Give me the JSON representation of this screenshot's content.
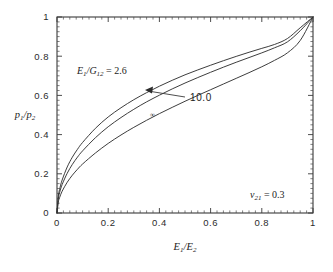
{
  "chart_data": {
    "type": "line",
    "title": "",
    "xlabel": "E₁/E₂",
    "ylabel": "p₁/p₂",
    "xlim": [
      0,
      1
    ],
    "ylim": [
      0,
      1
    ],
    "xticks": [
      "0",
      "0.2",
      "0.4",
      "0.6",
      "0.8",
      "1"
    ],
    "xtick_values": [
      0,
      0.2,
      0.4,
      0.6,
      0.8,
      1
    ],
    "yticks": [
      "0",
      "0.2",
      "0.4",
      "0.6",
      "0.8",
      "1"
    ],
    "ytick_values": [
      0,
      0.2,
      0.4,
      0.6,
      0.8,
      1
    ],
    "grid": false,
    "legend_position": "inline-annotations",
    "minor_ticks": true,
    "series": [
      {
        "name": "E1/G12 = 2.6",
        "label": "2.6",
        "x": [
          0.0,
          0.005,
          0.01,
          0.02,
          0.04,
          0.06,
          0.08,
          0.1,
          0.15,
          0.2,
          0.25,
          0.3,
          0.35,
          0.4,
          0.45,
          0.5,
          0.55,
          0.6,
          0.65,
          0.7,
          0.75,
          0.8,
          0.85,
          0.9,
          0.95,
          1.0
        ],
        "y": [
          0.0,
          0.085,
          0.12,
          0.168,
          0.235,
          0.285,
          0.325,
          0.36,
          0.432,
          0.49,
          0.537,
          0.578,
          0.614,
          0.647,
          0.677,
          0.705,
          0.73,
          0.754,
          0.777,
          0.799,
          0.82,
          0.84,
          0.86,
          0.89,
          0.945,
          1.0
        ]
      },
      {
        "name": "E1/G12 = 10.0",
        "label": "10.0",
        "x": [
          0.0,
          0.005,
          0.01,
          0.02,
          0.04,
          0.06,
          0.08,
          0.1,
          0.15,
          0.2,
          0.25,
          0.3,
          0.35,
          0.4,
          0.45,
          0.5,
          0.55,
          0.6,
          0.65,
          0.7,
          0.75,
          0.8,
          0.85,
          0.9,
          0.95,
          1.0
        ],
        "y": [
          0.0,
          0.072,
          0.103,
          0.145,
          0.203,
          0.248,
          0.285,
          0.317,
          0.384,
          0.44,
          0.487,
          0.529,
          0.567,
          0.601,
          0.633,
          0.663,
          0.691,
          0.718,
          0.744,
          0.769,
          0.793,
          0.817,
          0.843,
          0.873,
          0.93,
          1.0
        ]
      },
      {
        "name": "E1/G12 = infinity",
        "label": "∞",
        "x": [
          0.0,
          0.005,
          0.01,
          0.02,
          0.04,
          0.06,
          0.08,
          0.1,
          0.15,
          0.2,
          0.25,
          0.3,
          0.35,
          0.4,
          0.45,
          0.5,
          0.55,
          0.6,
          0.65,
          0.7,
          0.75,
          0.8,
          0.85,
          0.9,
          0.95,
          1.0
        ],
        "y": [
          0.0,
          0.055,
          0.078,
          0.111,
          0.157,
          0.193,
          0.223,
          0.25,
          0.306,
          0.355,
          0.398,
          0.437,
          0.473,
          0.507,
          0.539,
          0.57,
          0.6,
          0.629,
          0.658,
          0.687,
          0.716,
          0.746,
          0.779,
          0.817,
          0.88,
          1.0
        ]
      }
    ],
    "annotations": [
      {
        "name": "curve-label-2p6",
        "text_prefix": "E",
        "text_sub1": "1",
        "text_mid": "/G",
        "text_sub2": "12",
        "text_value": " = 2.6"
      },
      {
        "name": "curve-label-10",
        "text": "10.0"
      },
      {
        "name": "curve-label-infinity",
        "text": "∞"
      },
      {
        "name": "poisson-ratio-note",
        "text_prefix": "ν",
        "text_sub": "21",
        "text_value": " = 0.3"
      }
    ]
  },
  "axes": {
    "y_label_main": "p",
    "y_label_sub1": "1",
    "y_label_mid": "/p",
    "y_label_sub2": "2",
    "x_label_main": "E",
    "x_label_sub1": "1",
    "x_label_mid": "/E",
    "x_label_sub2": "2"
  },
  "colors": {
    "background": "#ffffff",
    "axis": "#3a3a3a",
    "curve": "#333333",
    "text": "#1c1c1c"
  }
}
